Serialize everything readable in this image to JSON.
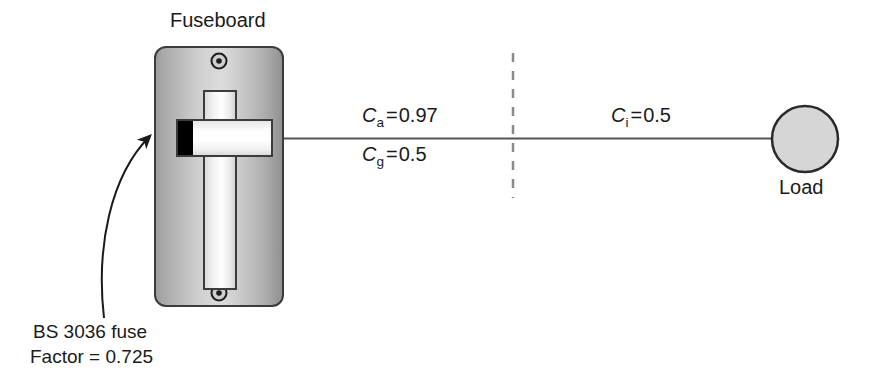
{
  "diagram": {
    "title_label": "Fuseboard",
    "load_label": "Load",
    "coefficients": [
      {
        "symbol": "C",
        "subscript": "a",
        "equals": "=",
        "value": "0.97",
        "full": "Ca = 0.97"
      },
      {
        "symbol": "C",
        "subscript": "g",
        "equals": "=",
        "value": "0.5",
        "full": "Cg = 0.5"
      },
      {
        "symbol": "C",
        "subscript": "i",
        "equals": "=",
        "value": "0.5",
        "full": "Ci = 0.5"
      }
    ],
    "annotation": {
      "line1": "BS 3036 fuse",
      "line2": "Factor = 0.725"
    },
    "colors": {
      "ink": "#1a1a1a",
      "wire": "#555555",
      "panel_edge": "#3a3a3a",
      "panel_light": "#e8e8e8",
      "panel_mid": "#b6b6b6",
      "panel_dark": "#8e8e8e",
      "fuse_block": "#000000",
      "load_fill": "#d6d6d6",
      "dashed": "#8a8a8a"
    }
  }
}
